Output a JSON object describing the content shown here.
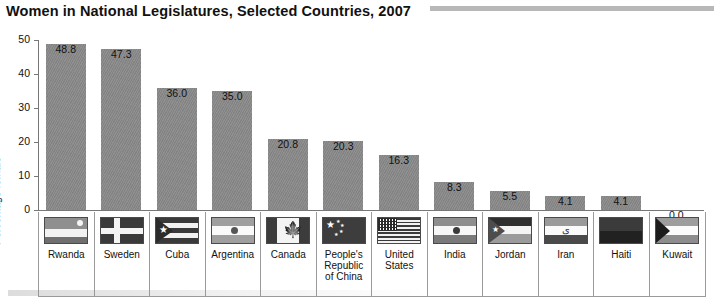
{
  "chart_data": {
    "type": "bar",
    "title": "Women in National Legislatures, Selected Countries, 2007",
    "xlabel": "",
    "ylabel": "Percentage female",
    "ylim": [
      0,
      50
    ],
    "yticks": [
      "0",
      "10",
      "20",
      "30",
      "40",
      "50"
    ],
    "grid": false,
    "legend": "none",
    "categories": [
      "Rwanda",
      "Sweden",
      "Cuba",
      "Argentina",
      "Canada",
      "People's\nRepublic\nof China",
      "United\nStates",
      "India",
      "Jordan",
      "Iran",
      "Haiti",
      "Kuwait"
    ],
    "values": [
      48.8,
      47.3,
      36.0,
      35.0,
      20.8,
      20.3,
      16.3,
      8.3,
      5.5,
      4.1,
      4.1,
      0.0
    ],
    "value_labels": [
      "48.8",
      "47.3",
      "36.0",
      "35.0",
      "20.8",
      "20.3",
      "16.3",
      "8.3",
      "5.5",
      "4.1",
      "4.1",
      "0.0"
    ],
    "bar_color": "#8a8a8a",
    "axis_color": "#777777"
  },
  "flags": [
    {
      "country": "Rwanda",
      "icon": "flag-rwanda-icon"
    },
    {
      "country": "Sweden",
      "icon": "flag-sweden-icon"
    },
    {
      "country": "Cuba",
      "icon": "flag-cuba-icon"
    },
    {
      "country": "Argentina",
      "icon": "flag-argentina-icon"
    },
    {
      "country": "Canada",
      "icon": "flag-canada-icon"
    },
    {
      "country": "People's Republic of China",
      "icon": "flag-china-icon"
    },
    {
      "country": "United States",
      "icon": "flag-united-states-icon"
    },
    {
      "country": "India",
      "icon": "flag-india-icon"
    },
    {
      "country": "Jordan",
      "icon": "flag-jordan-icon"
    },
    {
      "country": "Iran",
      "icon": "flag-iran-icon"
    },
    {
      "country": "Haiti",
      "icon": "flag-haiti-icon"
    },
    {
      "country": "Kuwait",
      "icon": "flag-kuwait-icon"
    }
  ]
}
